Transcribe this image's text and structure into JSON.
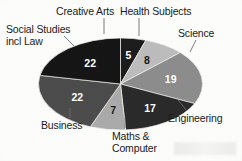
{
  "chart_data": {
    "type": "pie",
    "title": "",
    "subtitle": "",
    "xlabel": "",
    "ylabel": "",
    "legend_position": "callout-labels",
    "grid": false,
    "total": 110,
    "units": "percent",
    "categories": [
      "Creative Arts",
      "Health Subjects",
      "Science",
      "Engineering",
      "Maths & Computer",
      "Business",
      "Social Studies incl Law"
    ],
    "values": [
      5,
      8,
      19,
      17,
      7,
      22,
      22
    ],
    "colors": [
      "#1d1d1d",
      "#bdbdbd",
      "#8d8d8d",
      "#2b2b2b",
      "#ababab",
      "#4c4c4c",
      "#161616"
    ],
    "slices": [
      {
        "label": "Creative Arts",
        "value": 5,
        "value_text": "5",
        "color": "#1d1d1d",
        "label_color": "#ffffff"
      },
      {
        "label": "Health Subjects",
        "value": 8,
        "value_text": "8",
        "color": "#bdbdbd",
        "label_color": "#1b1b1b"
      },
      {
        "label": "Science",
        "value": 19,
        "value_text": "19",
        "color": "#8d8d8d",
        "label_color": "#ffffff"
      },
      {
        "label": "Engineering",
        "value": 17,
        "value_text": "17",
        "color": "#2b2b2b",
        "label_color": "#ffffff"
      },
      {
        "label": "Maths & Computer",
        "value": 7,
        "value_text": "7",
        "color": "#ababab",
        "label_color": "#1b1b1b"
      },
      {
        "label": "Business",
        "value": 22,
        "value_text": "22",
        "color": "#4c4c4c",
        "label_color": "#ffffff"
      },
      {
        "label": "Social Studies incl Law",
        "value": 22,
        "value_text": "22",
        "color": "#161616",
        "label_color": "#ffffff"
      }
    ]
  },
  "labels": {
    "creative_arts": "Creative Arts",
    "health_subjects": "Health Subjects",
    "science": "Science",
    "engineering": "Engineering",
    "maths_computer_line1": "Maths &",
    "maths_computer_line2": "Computer",
    "business": "Business",
    "social_studies_line1": "Social Studies",
    "social_studies_line2": "incl Law"
  },
  "values": {
    "creative_arts": "5",
    "health_subjects": "8",
    "science": "19",
    "engineering": "17",
    "maths_computer": "7",
    "business": "22",
    "social_studies": "22"
  },
  "style": {
    "background": "#fdfdfb",
    "text_color": "#1b1b1b",
    "leader_line_color": "#6f6f6f"
  }
}
